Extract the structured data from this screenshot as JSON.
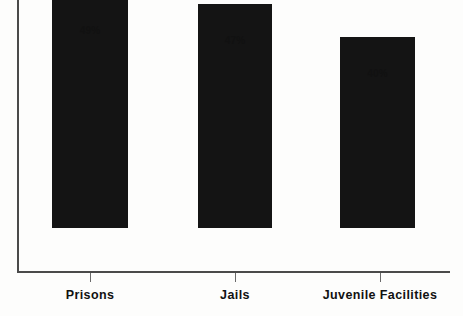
{
  "chart_data": {
    "type": "bar",
    "title": "",
    "subtitle": "",
    "xlabel": "",
    "ylabel": "",
    "categories": [
      "Prisons",
      "Jails",
      "Juvenile Facilities"
    ],
    "values": [
      49,
      47,
      40
    ],
    "value_labels": [
      "49%",
      "47%",
      "40%"
    ],
    "ylim": [
      0,
      57
    ],
    "grid": false,
    "legend": null,
    "axis_tick_labels": [],
    "bar_color": "#141414",
    "axis_color": "#4a4a4a",
    "background_color": "#fdfdfc",
    "annotations": []
  },
  "bars": [
    {
      "category": "Prisons",
      "value": 49,
      "label": "49%"
    },
    {
      "category": "Jails",
      "value": 47,
      "label": "47%"
    },
    {
      "category": "Juvenile Facilities",
      "value": 40,
      "label": "40%"
    }
  ]
}
